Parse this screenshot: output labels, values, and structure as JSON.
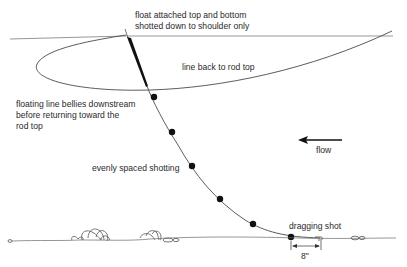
{
  "diagram": {
    "labels": {
      "float_note_line1": "float attached top and bottom",
      "float_note_line2": "shotted down to shoulder only",
      "rod_line": "line back to rod top",
      "belly_line1": "floating line bellies downstream",
      "belly_line2": "before returning toward the",
      "belly_line3": "rod top",
      "shotting": "evenly spaced shotting",
      "flow": "flow",
      "dragging": "dragging shot",
      "measure": "8\""
    },
    "colors": {
      "ink": "#2a2a2a",
      "line": "#4a4a4a",
      "background": "#ffffff"
    },
    "elements": {
      "shots_count": 6,
      "flow_direction": "left"
    }
  }
}
